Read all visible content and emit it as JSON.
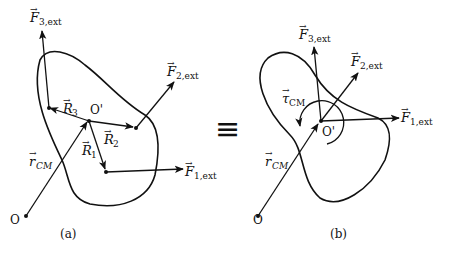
{
  "equivalence_symbol": "≡",
  "panel_a": {
    "caption": "(a)",
    "origin_label": "O",
    "cm_label": "O'",
    "r_cm": {
      "symbol": "r",
      "subscript": "CM"
    },
    "position_vectors": [
      {
        "symbol": "R",
        "subscript": "1"
      },
      {
        "symbol": "R",
        "subscript": "2"
      },
      {
        "symbol": "R",
        "subscript": "3"
      }
    ],
    "forces": [
      {
        "symbol": "F",
        "subscript": "1,ext"
      },
      {
        "symbol": "F",
        "subscript": "2,ext"
      },
      {
        "symbol": "F",
        "subscript": "3,ext"
      }
    ]
  },
  "panel_b": {
    "caption": "(b)",
    "origin_label": "O",
    "cm_label": "O'",
    "r_cm": {
      "symbol": "r",
      "subscript": "CM"
    },
    "torque": {
      "symbol": "τ",
      "subscript": "CM"
    },
    "forces": [
      {
        "symbol": "F",
        "subscript": "1,ext"
      },
      {
        "symbol": "F",
        "subscript": "2,ext"
      },
      {
        "symbol": "F",
        "subscript": "3,ext"
      }
    ]
  }
}
